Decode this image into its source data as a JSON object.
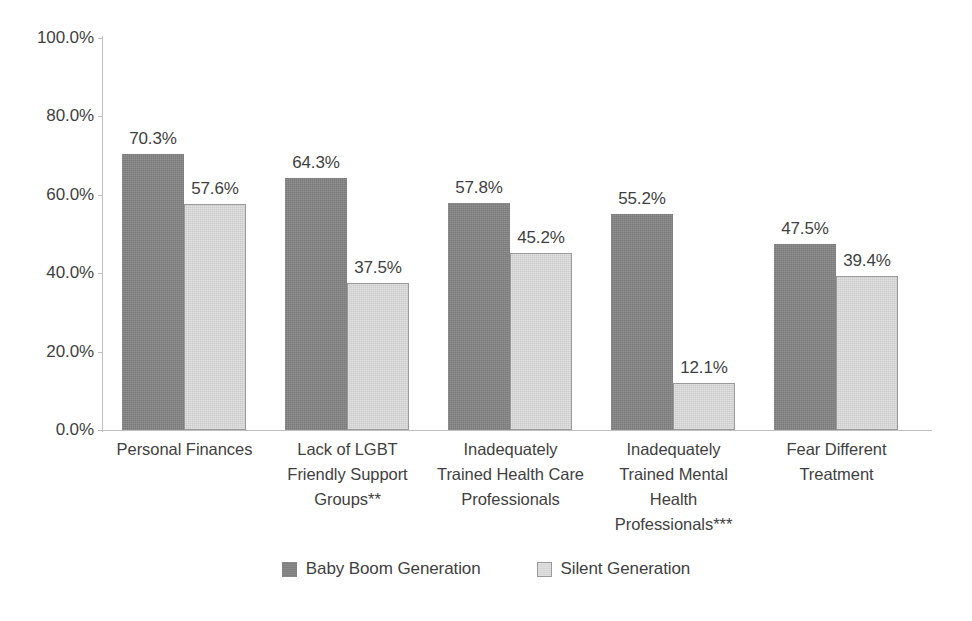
{
  "chart_data": {
    "type": "bar",
    "title": "",
    "subtitle": "",
    "xlabel": "",
    "ylabel": "",
    "ylim": [
      0,
      100
    ],
    "ytick_labels": [
      "100.0%",
      "80.0%",
      "60.0%",
      "40.0%",
      "20.0%",
      "0.0%"
    ],
    "ytick_values": [
      100,
      80,
      60,
      40,
      20,
      0
    ],
    "grid": false,
    "legend_position": "bottom",
    "categories": [
      "Personal Finances",
      "Lack of LGBT Friendly Support Groups**",
      "Inadequately Trained Health Care Professionals",
      "Inadequately Trained Mental Health Professionals***",
      "Fear Different Treatment"
    ],
    "category_lines": [
      [
        "Personal Finances"
      ],
      [
        "Lack of LGBT",
        "Friendly Support",
        "Groups**"
      ],
      [
        "Inadequately",
        "Trained Health Care",
        "Professionals"
      ],
      [
        "Inadequately",
        "Trained Mental",
        "Health",
        "Professionals***"
      ],
      [
        "Fear Different",
        "Treatment"
      ]
    ],
    "series": [
      {
        "name": "Baby Boom Generation",
        "color": "#848484",
        "values": [
          70.3,
          64.3,
          57.8,
          55.2,
          47.5
        ],
        "data_labels": [
          "70.3%",
          "64.3%",
          "57.8%",
          "55.2%",
          "47.5%"
        ]
      },
      {
        "name": "Silent Generation",
        "color": "#dedede",
        "values": [
          57.6,
          37.5,
          45.2,
          12.1,
          39.4
        ],
        "data_labels": [
          "57.6%",
          "37.5%",
          "45.2%",
          "12.1%",
          "39.4%"
        ]
      }
    ]
  },
  "colors": {
    "baby_boom": "#848484",
    "silent": "#dedede",
    "axis": "#bfbfbf",
    "text": "#3f3f3f",
    "background": "#ffffff"
  }
}
